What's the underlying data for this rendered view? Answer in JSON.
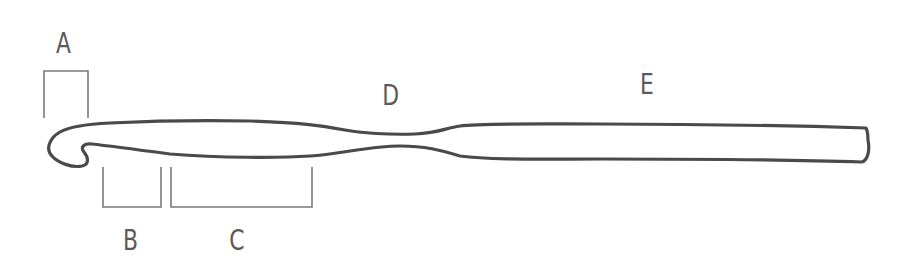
{
  "diagram": {
    "labels": {
      "a": "A",
      "b": "B",
      "c": "C",
      "d": "D",
      "e": "E"
    },
    "colors": {
      "outline": "#4a4a4a",
      "bracket": "#7a7a7a",
      "label": "#5a5a5a",
      "background": "#ffffff"
    }
  }
}
